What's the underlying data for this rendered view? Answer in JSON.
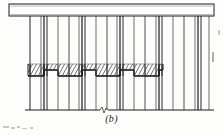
{
  "figure": {
    "caption": "(b)",
    "caption_x": 111,
    "caption_y": 113,
    "background_color": "#fdfdfc",
    "ink_color": "#1a1a1a",
    "ink_color_light": "#555555",
    "hatch_color": "#3a3a3a",
    "paper_speck_color": "#c9c6c0"
  },
  "drawing": {
    "type": "elevation-line-drawing",
    "description": "Elevation of vertical members supported between a top horizontal beam and a bottom ground line, with a hatched stepped band across the middle",
    "top_beam": {
      "x": 9,
      "y": 4,
      "width": 205,
      "height": 12,
      "stroke": "#1a1a1a",
      "stroke_width": 1,
      "fill": "#ffffff",
      "inner_line_y": 14.5
    },
    "ground_line": {
      "x1": 25,
      "x2": 214,
      "y": 110,
      "stroke": "#1a1a1a",
      "stroke_width": 1
    },
    "break_symbol": {
      "x": 100,
      "y": 110,
      "width": 8,
      "shape": "zigzag-break"
    },
    "verticals_top_y": 16,
    "verticals_bottom_y": 110,
    "verticals": [
      {
        "x": 30,
        "weight": 1.0,
        "shade": "#222222"
      },
      {
        "x": 41,
        "weight": 0.8,
        "shade": "#4a4a4a"
      },
      {
        "x": 44,
        "weight": 1.2,
        "shade": "#1a1a1a"
      },
      {
        "x": 47,
        "weight": 1.0,
        "shade": "#2a2a2a"
      },
      {
        "x": 58,
        "weight": 0.8,
        "shade": "#4a4a4a"
      },
      {
        "x": 69,
        "weight": 0.9,
        "shade": "#3a3a3a"
      },
      {
        "x": 79,
        "weight": 0.8,
        "shade": "#4a4a4a"
      },
      {
        "x": 82,
        "weight": 1.2,
        "shade": "#1a1a1a"
      },
      {
        "x": 85,
        "weight": 1.0,
        "shade": "#2a2a2a"
      },
      {
        "x": 96,
        "weight": 0.8,
        "shade": "#4a4a4a"
      },
      {
        "x": 107,
        "weight": 0.9,
        "shade": "#3a3a3a"
      },
      {
        "x": 117,
        "weight": 0.8,
        "shade": "#4a4a4a"
      },
      {
        "x": 120,
        "weight": 1.2,
        "shade": "#1a1a1a"
      },
      {
        "x": 123,
        "weight": 1.0,
        "shade": "#2a2a2a"
      },
      {
        "x": 134,
        "weight": 0.8,
        "shade": "#4a4a4a"
      },
      {
        "x": 145,
        "weight": 0.9,
        "shade": "#3a3a3a"
      },
      {
        "x": 156,
        "weight": 0.8,
        "shade": "#4a4a4a"
      },
      {
        "x": 159,
        "weight": 1.2,
        "shade": "#1a1a1a"
      },
      {
        "x": 162,
        "weight": 1.0,
        "shade": "#2a2a2a"
      },
      {
        "x": 173,
        "weight": 0.8,
        "shade": "#4a4a4a"
      },
      {
        "x": 184,
        "weight": 0.9,
        "shade": "#3a3a3a"
      },
      {
        "x": 195,
        "weight": 0.8,
        "shade": "#4a4a4a"
      },
      {
        "x": 198,
        "weight": 1.2,
        "shade": "#1a1a1a"
      },
      {
        "x": 201,
        "weight": 1.0,
        "shade": "#2a2a2a"
      },
      {
        "x": 209,
        "weight": 0.8,
        "shade": "#4a4a4a"
      }
    ],
    "hatch_band": {
      "x_start": 28,
      "x_end": 163,
      "top_y": 64,
      "step_high_y": 70,
      "step_low_y": 76,
      "hatch_spacing": 4,
      "hatch_angle_deg": 45,
      "stroke": "#1a1a1a",
      "heavy_stroke_width": 1.6,
      "steps": [
        {
          "x1": 28,
          "x2": 44,
          "level": "low"
        },
        {
          "x1": 44,
          "x2": 58,
          "level": "high"
        },
        {
          "x1": 58,
          "x2": 82,
          "level": "low"
        },
        {
          "x1": 82,
          "x2": 96,
          "level": "high"
        },
        {
          "x1": 96,
          "x2": 120,
          "level": "low"
        },
        {
          "x1": 120,
          "x2": 134,
          "level": "high"
        },
        {
          "x1": 134,
          "x2": 159,
          "level": "low"
        },
        {
          "x1": 159,
          "x2": 163,
          "level": "high"
        }
      ]
    },
    "right_tick": {
      "x": 213,
      "y1": 52,
      "y2": 62,
      "note": "small vertical tick at right edge"
    }
  },
  "artifacts": {
    "label": "scan-specks",
    "specks": [
      {
        "x": 3,
        "y": 126,
        "w": 6,
        "h": 2
      },
      {
        "x": 11,
        "y": 127,
        "w": 4,
        "h": 2
      },
      {
        "x": 17,
        "y": 126,
        "w": 3,
        "h": 2
      },
      {
        "x": 22,
        "y": 128,
        "w": 5,
        "h": 1
      },
      {
        "x": 30,
        "y": 127,
        "w": 3,
        "h": 2
      },
      {
        "x": 218,
        "y": 30,
        "w": 2,
        "h": 5
      }
    ]
  }
}
